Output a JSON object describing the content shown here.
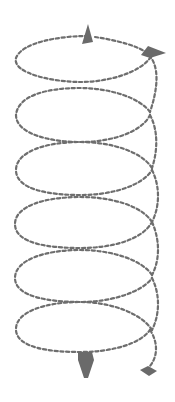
{
  "diagram": {
    "type": "helix-spiral",
    "loop_count": 6,
    "line_style": "dashed",
    "colors": {
      "background": "#ffffff",
      "stroke": "#6e6e6e",
      "arrow_fill": "#6a6a6a"
    },
    "arrows": [
      {
        "name": "top-up-arrow",
        "direction": "up"
      },
      {
        "name": "top-right-arrow",
        "direction": "right"
      },
      {
        "name": "bottom-down-arrow",
        "direction": "down"
      },
      {
        "name": "bottom-right-diamond",
        "direction": "down-right"
      }
    ]
  }
}
